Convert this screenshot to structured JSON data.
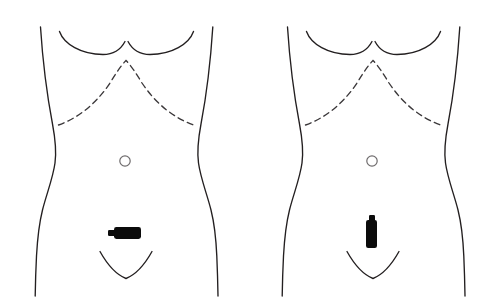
{
  "figure": {
    "background_color": "#ffffff",
    "outline_color": "#231f20",
    "dashed_color": "#3b383a",
    "navel_color": "#6e6b6c",
    "incision_color": "#0b0b0b",
    "width": 487,
    "height": 308,
    "panel_count": 2
  },
  "panels": [
    {
      "id": "panel-left",
      "name": "left-torso-diagram",
      "offset_x": 0,
      "label": "",
      "anatomy": {
        "torso_outline": "female anterior torso, chest to pelvis",
        "breast_curve": "bilateral inframammary fold curves meeting at midline",
        "costal_margin": "dashed inverted-V costal margin",
        "navel": {
          "cx": 125,
          "cy": 161,
          "r": 5.2
        },
        "pubic_curve": "U-shaped suprapubic hairline curve"
      },
      "incision": {
        "name": "transverse-incision-marker",
        "orientation": "horizontal",
        "x": 114,
        "y": 227,
        "width": 27,
        "height": 12,
        "tab": {
          "x": 108,
          "y": 230,
          "width": 7,
          "height": 6
        },
        "description": "horizontal transverse incision marker below navel"
      }
    },
    {
      "id": "panel-right",
      "name": "right-torso-diagram",
      "offset_x": 247,
      "label": "",
      "anatomy": {
        "torso_outline": "female anterior torso, chest to pelvis",
        "breast_curve": "bilateral inframammary fold curves meeting at midline",
        "costal_margin": "dashed inverted-V costal margin",
        "navel": {
          "cx": 372,
          "cy": 161,
          "r": 5.2
        },
        "pubic_curve": "U-shaped suprapubic hairline curve"
      },
      "incision": {
        "name": "vertical-incision-marker",
        "orientation": "vertical",
        "x": 366,
        "y": 220,
        "width": 11,
        "height": 28,
        "tab": {
          "x": 369,
          "y": 215,
          "width": 6,
          "height": 7
        },
        "description": "vertical midline incision marker below navel"
      }
    }
  ]
}
